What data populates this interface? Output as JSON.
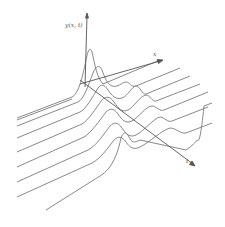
{
  "diagram": {
    "axes": {
      "y_label": "y(x, t)",
      "x_label": "x",
      "t_label": "t"
    },
    "curve_count": 8,
    "line_color": "#7a7a7a",
    "axis_color": "#555555",
    "background": "#ffffff"
  }
}
